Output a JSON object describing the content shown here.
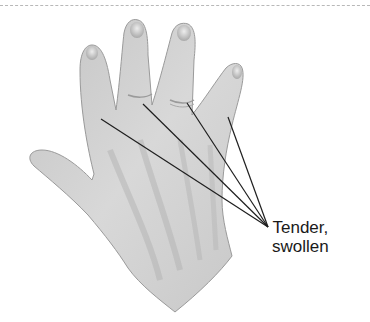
{
  "figure": {
    "annotation": {
      "line1": "Tender,",
      "line2": "swollen"
    },
    "pointer_target_count": 4,
    "colors": {
      "skin_light": "#dcdcdc",
      "skin_mid": "#b9b9b9",
      "skin_shadow": "#8f8f8f",
      "line": "#1e1e1e",
      "text": "#1a1a1a"
    }
  }
}
